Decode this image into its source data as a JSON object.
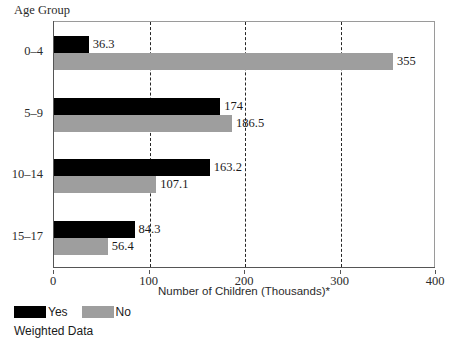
{
  "chart_data": {
    "type": "bar",
    "orientation": "horizontal",
    "title": "",
    "xlabel": "Number of Children (Thousands)*",
    "ylabel": "Age Group",
    "xlim": [
      0,
      400
    ],
    "xticks": [
      "0",
      "100",
      "200",
      "300",
      "400"
    ],
    "xtick_values": [
      0,
      100,
      200,
      300,
      400
    ],
    "gridlines": [
      100,
      200,
      300
    ],
    "grid": "dashed vertical at 100, 200, 300",
    "legend_position": "below-left",
    "categories": [
      "0–4",
      "5–9",
      "10–14",
      "15–17"
    ],
    "series": [
      {
        "name": "Yes",
        "color": "#000000",
        "values": [
          36.3,
          174,
          163.2,
          84.3
        ],
        "labels": [
          "36.3",
          "174",
          "163.2",
          "84.3"
        ]
      },
      {
        "name": "No",
        "color": "#9e9e9e",
        "values": [
          355,
          186.5,
          107.1,
          56.4
        ],
        "labels": [
          "355",
          "186.5",
          "107.1",
          "56.4"
        ]
      }
    ],
    "footnote": "Weighted Data"
  },
  "axis": {
    "y_caption": "Age Group",
    "x_title": "Number of Children (Thousands)*"
  },
  "legend": {
    "yes_label": "Yes",
    "no_label": "No",
    "note": "Weighted Data"
  }
}
